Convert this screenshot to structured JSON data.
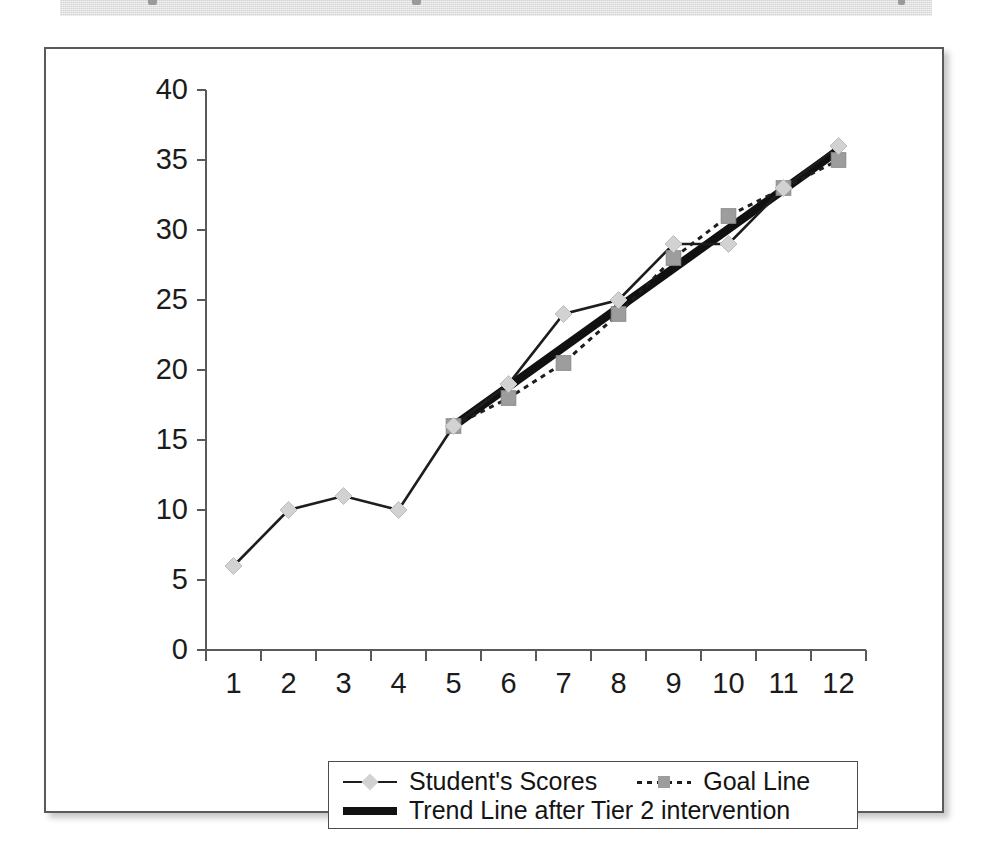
{
  "page": {
    "background_color": "#ffffff",
    "band_color": "#d6d6d6",
    "frame_border_color": "#5a5a5a"
  },
  "chart_data": {
    "type": "line",
    "title": "",
    "subtitle": "",
    "xlabel": "",
    "ylabel": "",
    "xlim": [
      0.5,
      12.5
    ],
    "ylim": [
      0,
      40
    ],
    "ytick_step": 5,
    "grid": false,
    "legend_position": "bottom",
    "categories": [
      "1",
      "2",
      "3",
      "4",
      "5",
      "6",
      "7",
      "8",
      "9",
      "10",
      "11",
      "12"
    ],
    "yticks": [
      "0",
      "5",
      "10",
      "15",
      "20",
      "25",
      "30",
      "35",
      "40"
    ],
    "series": [
      {
        "name": "Student's Scores",
        "style": "solid",
        "marker": "diamond",
        "marker_color": "#d2d2d2",
        "line_color": "#1d1d1d",
        "x": [
          1,
          2,
          3,
          4,
          5,
          6,
          7,
          8,
          9,
          10,
          11,
          12
        ],
        "values": [
          6,
          10,
          11,
          10,
          16,
          19,
          24,
          25,
          29,
          29,
          33,
          36
        ]
      },
      {
        "name": "Goal Line",
        "style": "dashed",
        "marker": "square",
        "marker_color": "#9d9d9d",
        "line_color": "#1d1d1d",
        "x": [
          5,
          6,
          7,
          8,
          9,
          10,
          11,
          12
        ],
        "values": [
          16,
          18,
          20.5,
          24,
          28,
          31,
          33,
          35
        ]
      },
      {
        "name": "Trend Line after Tier 2 intervention",
        "style": "thick-solid",
        "marker": "none",
        "line_color": "#111111",
        "x": [
          5,
          12
        ],
        "values": [
          16,
          35.7
        ]
      }
    ],
    "annotations": []
  },
  "legend": {
    "items": [
      {
        "label": "Student's Scores",
        "swatch": "solid-line-diamond-marker"
      },
      {
        "label": "Goal Line",
        "swatch": "dashed-line-square-marker"
      },
      {
        "label": "Trend Line after Tier 2 intervention",
        "swatch": "thick-solid-line"
      }
    ]
  }
}
